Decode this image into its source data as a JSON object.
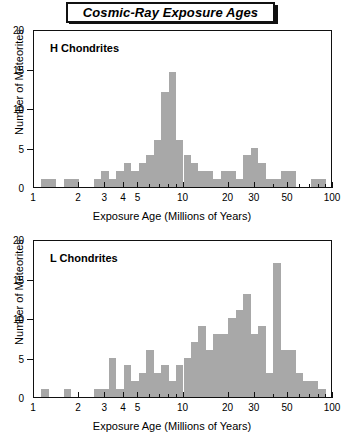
{
  "title": "Cosmic-Ray Exposure Ages",
  "axis": {
    "x_title": "Exposure Age (Millions of Years)",
    "y_title": "Number of Meteorites",
    "x_major_ticks": [
      1,
      2,
      3,
      4,
      5,
      10,
      20,
      30,
      50,
      100
    ],
    "x_minor_ticks": [
      6,
      7,
      8,
      9,
      40,
      60,
      70,
      80,
      90
    ],
    "y_ticks": [
      0,
      5,
      10,
      15,
      20
    ]
  },
  "chart_data": [
    {
      "type": "bar",
      "title": "H Chondrites",
      "xlabel": "Exposure Age (Millions of Years)",
      "ylabel": "Number of Meteorites",
      "xscale": "log",
      "xlim": [
        1,
        100
      ],
      "ylim": [
        0,
        20
      ],
      "grid": false,
      "legend": "none",
      "bin_edges": [
        1.0,
        1.122,
        1.259,
        1.413,
        1.585,
        1.778,
        1.995,
        2.239,
        2.512,
        2.818,
        3.162,
        3.548,
        3.981,
        4.467,
        5.012,
        5.623,
        6.31,
        7.079,
        7.943,
        8.913,
        10.0,
        11.22,
        12.59,
        14.13,
        15.85,
        17.78,
        19.95,
        22.39,
        25.12,
        28.18,
        31.62,
        35.48,
        39.81,
        44.67,
        50.12,
        56.23,
        63.1,
        70.79,
        79.43,
        89.13,
        100.0
      ],
      "values": [
        0,
        1,
        1,
        0,
        1,
        1,
        0,
        0,
        1,
        2,
        1,
        2,
        3,
        2,
        3,
        4,
        6,
        12,
        14.5,
        6,
        4,
        3,
        2,
        2,
        1,
        2,
        2,
        1,
        4,
        5,
        3,
        1,
        1,
        2,
        2,
        0,
        0,
        1,
        1,
        0
      ]
    },
    {
      "type": "bar",
      "title": "L Chondrites",
      "xlabel": "Exposure Age (Millions of Years)",
      "ylabel": "Number of Meteorites",
      "xscale": "log",
      "xlim": [
        1,
        100
      ],
      "ylim": [
        0,
        20
      ],
      "grid": false,
      "legend": "none",
      "bin_edges": [
        1.0,
        1.122,
        1.259,
        1.413,
        1.585,
        1.778,
        1.995,
        2.239,
        2.512,
        2.818,
        3.162,
        3.548,
        3.981,
        4.467,
        5.012,
        5.623,
        6.31,
        7.079,
        7.943,
        8.913,
        10.0,
        11.22,
        12.59,
        14.13,
        15.85,
        17.78,
        19.95,
        22.39,
        25.12,
        28.18,
        31.62,
        35.48,
        39.81,
        44.67,
        50.12,
        56.23,
        63.1,
        70.79,
        79.43,
        89.13,
        100.0
      ],
      "values": [
        0,
        1,
        0,
        0,
        1,
        0,
        0,
        0,
        1,
        1,
        5,
        1,
        4,
        2,
        3,
        6,
        3,
        4,
        2,
        4,
        5,
        7,
        9,
        6,
        8,
        8,
        10,
        11,
        13,
        8,
        9,
        3,
        17,
        6,
        6,
        3,
        2,
        2,
        1,
        0
      ]
    }
  ],
  "colors": {
    "bar_fill": "#a8a8a8",
    "axis": "#111111",
    "background": "#ffffff"
  }
}
